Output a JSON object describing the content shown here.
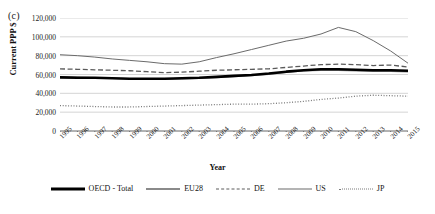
{
  "panel": {
    "label": "(c)"
  },
  "chart_data": {
    "type": "line",
    "title": "",
    "xlabel": "Year",
    "ylabel": "Current PPP $",
    "ylim": [
      0,
      120000
    ],
    "yticks": [
      "0",
      "20,000",
      "40,000",
      "60,000",
      "80,000",
      "100,000",
      "120,000"
    ],
    "ytick_values": [
      0,
      20000,
      40000,
      60000,
      80000,
      100000,
      120000
    ],
    "grid": true,
    "legend_position": "bottom",
    "categories": [
      "1995",
      "1996",
      "1997",
      "1998",
      "1999",
      "2000",
      "2001",
      "2002",
      "2003",
      "2004",
      "2005",
      "2006",
      "2007",
      "2008",
      "2009",
      "2010",
      "2011",
      "2012",
      "2013",
      "2014",
      "2015"
    ],
    "series": [
      {
        "name": "OECD - Total",
        "style": "solid-thick",
        "color": "#000000",
        "values": [
          57000,
          56500,
          56500,
          56000,
          55500,
          55500,
          55500,
          56000,
          56500,
          57500,
          58500,
          59500,
          61000,
          63000,
          64500,
          65500,
          65500,
          65000,
          64500,
          64500,
          64000
        ]
      },
      {
        "name": "EU28",
        "style": "solid-medium",
        "color": "#8a8a8a",
        "values": [
          57500,
          57000,
          56500,
          56000,
          55500,
          55000,
          55000,
          55500,
          56000,
          57000,
          58000,
          59000,
          60500,
          62500,
          64000,
          64500,
          64500,
          64000,
          63500,
          63500,
          63000
        ]
      },
      {
        "name": "DE",
        "style": "dashed",
        "color": "#5a5a5a",
        "values": [
          66000,
          65500,
          65000,
          64500,
          64000,
          63000,
          62000,
          62500,
          63500,
          64500,
          65000,
          65500,
          66000,
          67500,
          69000,
          70500,
          71000,
          70500,
          69500,
          70000,
          68000
        ]
      },
      {
        "name": "US",
        "style": "solid-thin",
        "color": "#6b6b6b",
        "values": [
          81000,
          80000,
          78500,
          76500,
          75000,
          73500,
          71500,
          71000,
          73500,
          78000,
          82000,
          86500,
          91000,
          95500,
          98500,
          103000,
          110000,
          105500,
          96000,
          85000,
          72000
        ]
      },
      {
        "name": "JP",
        "style": "dotted",
        "color": "#7a7a7a",
        "values": [
          27000,
          26500,
          26000,
          25500,
          25500,
          26000,
          26500,
          27000,
          27500,
          28000,
          28500,
          28500,
          29000,
          30000,
          31500,
          33500,
          35000,
          37000,
          38000,
          37500,
          37000
        ]
      }
    ]
  },
  "legend": {
    "items": [
      {
        "label": "OECD - Total"
      },
      {
        "label": "EU28"
      },
      {
        "label": "DE"
      },
      {
        "label": "US"
      },
      {
        "label": "JP"
      }
    ]
  }
}
